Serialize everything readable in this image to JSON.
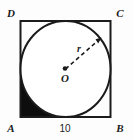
{
  "figure": {
    "background_color": "#fdfdfd",
    "stroke_color": "#1b1b1b",
    "shade_color": "#0d0d0d",
    "vertices": {
      "top_left": "D",
      "top_right": "C",
      "bottom_left": "A",
      "bottom_right": "B"
    },
    "center_label": "O",
    "radius_label": "r",
    "side_label": "10"
  }
}
